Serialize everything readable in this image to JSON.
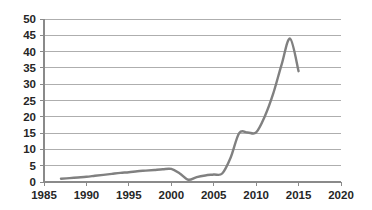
{
  "chart_data": {
    "type": "line",
    "title": "",
    "subtitle": "",
    "xlabel": "",
    "ylabel": "",
    "xlim": [
      1985,
      2020
    ],
    "ylim": [
      0,
      50
    ],
    "grid": true,
    "legend": false,
    "legend_position": "none",
    "x_ticks": [
      "1985",
      "1990",
      "1995",
      "2000",
      "2005",
      "2010",
      "2015",
      "2020"
    ],
    "x_tick_values": [
      1985,
      1990,
      1995,
      2000,
      2005,
      2010,
      2015,
      2020
    ],
    "y_ticks": [
      "0",
      "5",
      "10",
      "15",
      "20",
      "25",
      "30",
      "35",
      "40",
      "45",
      "50"
    ],
    "y_tick_values": [
      0,
      5,
      10,
      15,
      20,
      25,
      30,
      35,
      40,
      45,
      50
    ],
    "series": [
      {
        "name": "series-1",
        "color": "#808080",
        "marker": "none",
        "x": [
          1987,
          1988,
          1989,
          1990,
          1991,
          1992,
          1993,
          1994,
          1995,
          1996,
          1997,
          1998,
          1999,
          2000,
          2001,
          2002,
          2003,
          2004,
          2005,
          2006,
          2007,
          2008,
          2009,
          2010,
          2011,
          2012,
          2013,
          2014,
          2015
        ],
        "values": [
          1.0,
          1.2,
          1.4,
          1.6,
          1.9,
          2.2,
          2.5,
          2.8,
          3.0,
          3.3,
          3.5,
          3.7,
          3.9,
          4.0,
          2.6,
          0.7,
          1.5,
          2.0,
          2.3,
          2.6,
          7.5,
          15.0,
          15.2,
          15.2,
          20.0,
          27.0,
          36.0,
          44.0,
          34.0
        ]
      }
    ]
  },
  "style": {
    "background": "#ffffff",
    "grid_color": "#9a9a9a",
    "axis_color": "#8a8a8a",
    "label_color": "#262626",
    "line_color": "#808080"
  }
}
